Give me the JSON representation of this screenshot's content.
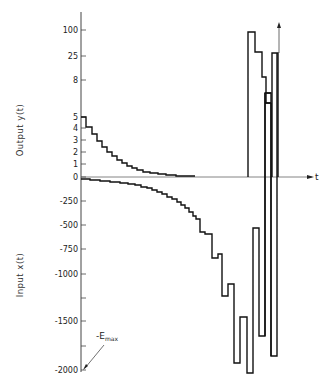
{
  "chart_data": {
    "type": "line",
    "subtype": "step",
    "title": "",
    "xlabel": "t",
    "y_upper_label": "Output y(t)",
    "y_lower_label": "Input x(t)",
    "upper_ticks": [
      {
        "label": "100",
        "value": 100,
        "y": 30
      },
      {
        "label": "25",
        "value": 25,
        "y": 56
      },
      {
        "label": "8",
        "value": 8,
        "y": 80
      },
      {
        "label": "5",
        "value": 5,
        "y": 117
      },
      {
        "label": "4",
        "value": 4,
        "y": 128
      },
      {
        "label": "3",
        "value": 3,
        "y": 140
      },
      {
        "label": "2",
        "value": 2,
        "y": 152
      },
      {
        "label": "1",
        "value": 1,
        "y": 164
      },
      {
        "label": "0",
        "value": 0,
        "y": 177
      }
    ],
    "lower_ticks": [
      {
        "label": "-250",
        "value": -250,
        "y": 201
      },
      {
        "label": "-500",
        "value": -500,
        "y": 225
      },
      {
        "label": "-750",
        "value": -750,
        "y": 249
      },
      {
        "label": "-1000",
        "value": -1000,
        "y": 274
      },
      {
        "label": "",
        "value": -1250,
        "y": 298
      },
      {
        "label": "-1500",
        "value": -1500,
        "y": 321
      },
      {
        "label": "",
        "value": -1750,
        "y": 346
      },
      {
        "label": "-2000",
        "value": -2000,
        "y": 370
      }
    ],
    "annotations": [
      {
        "text": "-E",
        "subscript": "max",
        "points_to_value": -2000
      }
    ],
    "series": [
      {
        "name": "Output y(t) decaying",
        "description": "staircase decaying from 5 toward 0",
        "points": [
          [
            81,
            117
          ],
          [
            86,
            117
          ],
          [
            86,
            127
          ],
          [
            92,
            127
          ],
          [
            92,
            134
          ],
          [
            97,
            134
          ],
          [
            97,
            141
          ],
          [
            102,
            141
          ],
          [
            102,
            147
          ],
          [
            107,
            147
          ],
          [
            107,
            152
          ],
          [
            112,
            152
          ],
          [
            112,
            156
          ],
          [
            117,
            156
          ],
          [
            117,
            160
          ],
          [
            122,
            160
          ],
          [
            122,
            163
          ],
          [
            127,
            163
          ],
          [
            127,
            166
          ],
          [
            132,
            166
          ],
          [
            132,
            168
          ],
          [
            137,
            168
          ],
          [
            137,
            170
          ],
          [
            143,
            170
          ],
          [
            143,
            172
          ],
          [
            150,
            172
          ],
          [
            150,
            173
          ],
          [
            158,
            173
          ],
          [
            158,
            174
          ],
          [
            166,
            174
          ],
          [
            166,
            175
          ],
          [
            176,
            175
          ],
          [
            176,
            176
          ],
          [
            195,
            176
          ]
        ]
      },
      {
        "name": "Input x(t)",
        "description": "staircase decreasing toward -E_max then oscillating",
        "points": [
          [
            81,
            179
          ],
          [
            90,
            179
          ],
          [
            90,
            180
          ],
          [
            100,
            180
          ],
          [
            100,
            181
          ],
          [
            110,
            181
          ],
          [
            110,
            182
          ],
          [
            120,
            182
          ],
          [
            120,
            183
          ],
          [
            128,
            183
          ],
          [
            128,
            184
          ],
          [
            135,
            184
          ],
          [
            135,
            185
          ],
          [
            141,
            185
          ],
          [
            141,
            187
          ],
          [
            147,
            187
          ],
          [
            147,
            188
          ],
          [
            152,
            188
          ],
          [
            152,
            190
          ],
          [
            157,
            190
          ],
          [
            157,
            192
          ],
          [
            162,
            192
          ],
          [
            162,
            194
          ],
          [
            167,
            194
          ],
          [
            167,
            197
          ],
          [
            172,
            197
          ],
          [
            172,
            199
          ],
          [
            177,
            199
          ],
          [
            177,
            202
          ],
          [
            181,
            202
          ],
          [
            181,
            205
          ],
          [
            185,
            205
          ],
          [
            185,
            208
          ],
          [
            189,
            208
          ],
          [
            189,
            212
          ],
          [
            193,
            212
          ],
          [
            193,
            216
          ],
          [
            196,
            216
          ],
          [
            196,
            219
          ],
          [
            200,
            219
          ],
          [
            200,
            232
          ],
          [
            205,
            232
          ],
          [
            205,
            234
          ],
          [
            212,
            234
          ],
          [
            212,
            258
          ],
          [
            212,
            258
          ],
          [
            218,
            258
          ],
          [
            218,
            254
          ],
          [
            222,
            254
          ],
          [
            222,
            296
          ],
          [
            228,
            296
          ],
          [
            228,
            284
          ],
          [
            234,
            284
          ],
          [
            234,
            363
          ],
          [
            240,
            363
          ],
          [
            240,
            317
          ],
          [
            247,
            317
          ],
          [
            247,
            373
          ],
          [
            253,
            373
          ],
          [
            253,
            228
          ],
          [
            259,
            228
          ],
          [
            259,
            336
          ],
          [
            265,
            336
          ],
          [
            265,
            93
          ],
          [
            271,
            93
          ],
          [
            271,
            356
          ],
          [
            277,
            356
          ],
          [
            277,
            53
          ]
        ]
      },
      {
        "name": "Output y(t) burst",
        "description": "large output pulses near 100, 25, 8",
        "points": [
          [
            248,
            177
          ],
          [
            248,
            32
          ],
          [
            255,
            32
          ],
          [
            255,
            52
          ],
          [
            262,
            52
          ],
          [
            262,
            77
          ],
          [
            266,
            77
          ],
          [
            266,
            103
          ],
          [
            271,
            103
          ]
        ]
      },
      {
        "name": "Output right pulse",
        "points": [
          [
            272,
            177
          ],
          [
            272,
            53
          ],
          [
            278,
            53
          ],
          [
            278,
            177
          ]
        ]
      }
    ],
    "axes": {
      "y_axis_x": 81,
      "y_axis_top": 12,
      "y_axis_bottom": 372,
      "x_axis_y": 177,
      "x_axis_end": 312,
      "vertical_arrow_x": 279,
      "vertical_arrow_top": 22
    }
  },
  "labels": {
    "output": "Output y(t)",
    "input": "Input x(t)",
    "t": "t",
    "emax": "-E",
    "emax_sub": "max"
  }
}
